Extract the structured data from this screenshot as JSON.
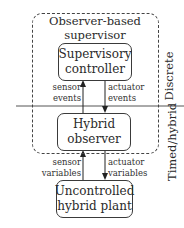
{
  "diagram": {
    "supervisor_group": {
      "title_line1": "Observer-based",
      "title_line2": "supervisor"
    },
    "supervisory_controller": {
      "line1": "Supervisory",
      "line2": "controller"
    },
    "hybrid_observer": {
      "line1": "Hybrid",
      "line2": "observer"
    },
    "plant": {
      "line1": "Uncontrolled",
      "line2": "hybrid plant"
    },
    "edges": {
      "sensor_events": {
        "line1": "sensor",
        "line2": "events"
      },
      "actuator_events": {
        "line1": "actuator",
        "line2": "events"
      },
      "sensor_variables": {
        "line1": "sensor",
        "line2": "variables"
      },
      "actuator_variables": {
        "line1": "actuator",
        "line2": "variables"
      }
    },
    "layers": {
      "upper": "Discrete",
      "lower": "Timed/hybrid"
    }
  }
}
